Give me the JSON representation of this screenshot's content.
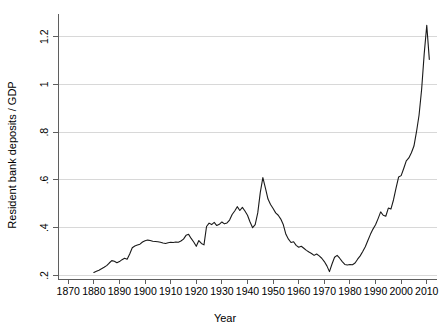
{
  "chart_data": {
    "type": "line",
    "title": "",
    "xlabel": "Year",
    "ylabel": "Resident bank deposits / GDP",
    "xlim": [
      1866,
      2014
    ],
    "ylim": [
      0.185,
      1.27
    ],
    "grid": true,
    "legend": "none",
    "xticks": [
      1870,
      1880,
      1890,
      1900,
      1910,
      1920,
      1930,
      1940,
      1950,
      1960,
      1970,
      1980,
      1990,
      2000,
      2010
    ],
    "xtick_labels": [
      "1870",
      "1880",
      "1890",
      "1900",
      "1910",
      "1920",
      "1930",
      "1940",
      "1950",
      "1960",
      "1970",
      "1980",
      "1990",
      "2000",
      "2010"
    ],
    "yticks": [
      0.2,
      0.4,
      0.6,
      0.8,
      1.0,
      1.2
    ],
    "ytick_labels": [
      ".2",
      ".4",
      ".6",
      ".8",
      "1",
      "1.2"
    ],
    "line_color": "#1a1a1a",
    "grid_color": "#d8d8d8",
    "axis_color": "#5f5f5f",
    "series": [
      {
        "name": "Resident bank deposits / GDP",
        "x": [
          1880,
          1881,
          1882,
          1883,
          1884,
          1885,
          1886,
          1887,
          1888,
          1889,
          1890,
          1891,
          1892,
          1893,
          1894,
          1895,
          1896,
          1897,
          1898,
          1899,
          1900,
          1901,
          1902,
          1903,
          1904,
          1905,
          1906,
          1907,
          1908,
          1909,
          1910,
          1911,
          1912,
          1913,
          1914,
          1915,
          1916,
          1917,
          1918,
          1919,
          1920,
          1921,
          1922,
          1923,
          1924,
          1925,
          1926,
          1927,
          1928,
          1929,
          1930,
          1931,
          1932,
          1933,
          1934,
          1935,
          1936,
          1937,
          1938,
          1939,
          1940,
          1941,
          1942,
          1943,
          1944,
          1945,
          1946,
          1947,
          1948,
          1949,
          1950,
          1951,
          1952,
          1953,
          1954,
          1955,
          1956,
          1957,
          1958,
          1959,
          1960,
          1961,
          1962,
          1963,
          1964,
          1965,
          1966,
          1967,
          1968,
          1969,
          1970,
          1971,
          1972,
          1973,
          1974,
          1975,
          1976,
          1977,
          1978,
          1979,
          1980,
          1981,
          1982,
          1983,
          1984,
          1985,
          1986,
          1987,
          1988,
          1989,
          1990,
          1991,
          1992,
          1993,
          1994,
          1995,
          1996,
          1997,
          1998,
          1999,
          2000,
          2001,
          2002,
          2003,
          2004,
          2005,
          2006,
          2007,
          2008,
          2009,
          2010,
          2011
        ],
        "y": [
          0.212,
          0.217,
          0.222,
          0.228,
          0.234,
          0.241,
          0.252,
          0.262,
          0.259,
          0.253,
          0.258,
          0.266,
          0.272,
          0.268,
          0.29,
          0.316,
          0.323,
          0.327,
          0.331,
          0.34,
          0.345,
          0.348,
          0.346,
          0.343,
          0.342,
          0.341,
          0.339,
          0.336,
          0.334,
          0.337,
          0.339,
          0.338,
          0.34,
          0.339,
          0.344,
          0.352,
          0.368,
          0.372,
          0.355,
          0.34,
          0.322,
          0.346,
          0.334,
          0.328,
          0.405,
          0.419,
          0.413,
          0.422,
          0.409,
          0.414,
          0.424,
          0.416,
          0.42,
          0.432,
          0.455,
          0.47,
          0.488,
          0.472,
          0.485,
          0.47,
          0.452,
          0.424,
          0.4,
          0.413,
          0.462,
          0.548,
          0.61,
          0.566,
          0.52,
          0.497,
          0.48,
          0.462,
          0.452,
          0.436,
          0.412,
          0.372,
          0.352,
          0.338,
          0.341,
          0.326,
          0.318,
          0.322,
          0.314,
          0.305,
          0.298,
          0.292,
          0.284,
          0.29,
          0.282,
          0.272,
          0.258,
          0.24,
          0.216,
          0.248,
          0.276,
          0.284,
          0.272,
          0.258,
          0.246,
          0.244,
          0.246,
          0.245,
          0.252,
          0.268,
          0.282,
          0.3,
          0.32,
          0.346,
          0.372,
          0.394,
          0.412,
          0.438,
          0.466,
          0.452,
          0.448,
          0.482,
          0.478,
          0.516,
          0.566,
          0.612,
          0.618,
          0.648,
          0.68,
          0.692,
          0.714,
          0.742,
          0.802,
          0.872,
          0.98,
          1.128,
          1.248,
          1.105
        ]
      }
    ]
  },
  "axes": {
    "y_title": "Resident bank deposits / GDP",
    "x_title": "Year"
  }
}
